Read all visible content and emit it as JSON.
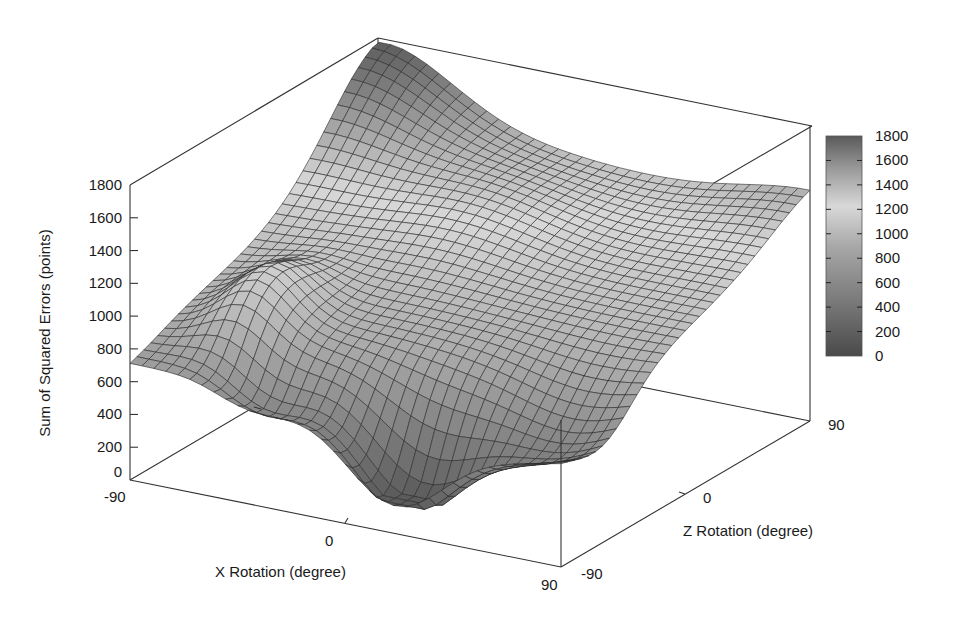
{
  "chart_data": {
    "type": "surface3d",
    "title": "",
    "xlabel": "X Rotation (degree)",
    "ylabel": "Z Rotation (degree)",
    "zlabel": "Sum of Squared Errors (points)",
    "x_ticks": [
      "-90",
      "0",
      "90"
    ],
    "y_ticks": [
      "-90",
      "0",
      "90"
    ],
    "z_ticks": [
      "0",
      "200",
      "400",
      "600",
      "800",
      "1000",
      "1200",
      "1400",
      "1600",
      "1800"
    ],
    "xlim": [
      -90,
      90
    ],
    "ylim": [
      -90,
      90
    ],
    "zlim": [
      0,
      1800
    ],
    "colorbar": {
      "ticks": [
        "0",
        "200",
        "400",
        "600",
        "800",
        "1000",
        "1200",
        "1400",
        "1600",
        "1800"
      ],
      "range": [
        0,
        1800
      ],
      "colormap": "gray (dark-light-dark)"
    },
    "grid": false,
    "legend": "none",
    "surface_description": "Error surface over X and Z rotation; minimum (~250) near X≈0..30, Z≈-90..-60; high values (~1700) near X=-90..-60, Z=90 and ~1400 toward X=90, Z=90; ridge ~1200 near X=-60, Z=-30; front-left edge ~880 at X=-90, Z=-90",
    "sample_points": [
      {
        "x": -90,
        "z": -90,
        "value": 880
      },
      {
        "x": -60,
        "z": -60,
        "value": 1200
      },
      {
        "x": -90,
        "z": 90,
        "value": 1700
      },
      {
        "x": 0,
        "z": 90,
        "value": 1350
      },
      {
        "x": 90,
        "z": 90,
        "value": 1400
      },
      {
        "x": 0,
        "z": 0,
        "value": 1000
      },
      {
        "x": 20,
        "z": -80,
        "value": 250
      },
      {
        "x": 90,
        "z": -90,
        "value": 500
      },
      {
        "x": 90,
        "z": 0,
        "value": 700
      }
    ]
  },
  "colors": {
    "mesh_line": "#2a2a2a",
    "box_line": "#333333",
    "colorbar_dark": "#555555",
    "colorbar_light": "#d4d4d4"
  }
}
